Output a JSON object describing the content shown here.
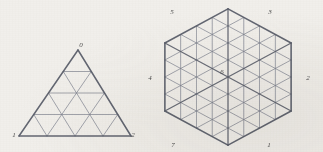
{
  "figure": {
    "background_color": "#f1efeb",
    "line_color": "#7b7f8c",
    "line_color_dark": "#5b5f6b",
    "label_color": "#4a4a4a",
    "panels": [
      {
        "id": "left-triangle",
        "shape": "triangle",
        "subdivision": 4,
        "vertex_labels": [
          {
            "text": "0",
            "position": "top",
            "x": 81,
            "y": 47
          },
          {
            "text": "1",
            "position": "bottom-left",
            "x": 14,
            "y": 137
          },
          {
            "text": "2",
            "position": "bottom-right",
            "x": 133,
            "y": 137
          }
        ],
        "geometry": {
          "apex": {
            "x": 78,
            "y": 50
          },
          "bottom_left": {
            "x": 19,
            "y": 136
          },
          "bottom_right": {
            "x": 131,
            "y": 136
          }
        }
      },
      {
        "id": "right-hexagon",
        "shape": "hexagon",
        "sectors": 6,
        "subdivision": 4,
        "vertex_labels": [
          {
            "text": "5",
            "position": "top-left",
            "x": 172,
            "y": 14
          },
          {
            "text": "3",
            "position": "top-right",
            "x": 270,
            "y": 14
          },
          {
            "text": "2",
            "position": "right",
            "x": 308,
            "y": 80
          },
          {
            "text": "1",
            "position": "bottom-right",
            "x": 269,
            "y": 147
          },
          {
            "text": "7",
            "position": "bottom-left",
            "x": 173,
            "y": 147
          },
          {
            "text": "4",
            "position": "left",
            "x": 150,
            "y": 80
          },
          {
            "text": "6",
            "position": "center",
            "x": 222,
            "y": 74
          }
        ],
        "geometry": {
          "center": {
            "x": 228,
            "y": 77
          },
          "radius": 74
        }
      }
    ]
  },
  "chart_data": {
    "type": "diagram",
    "title": "",
    "series": [
      {
        "name": "left-triangle",
        "vertices": 3,
        "subdivision": 4,
        "small_triangles": 16
      },
      {
        "name": "right-hexagon",
        "vertices": 7,
        "subdivision": 4,
        "small_triangles": 96
      }
    ]
  }
}
